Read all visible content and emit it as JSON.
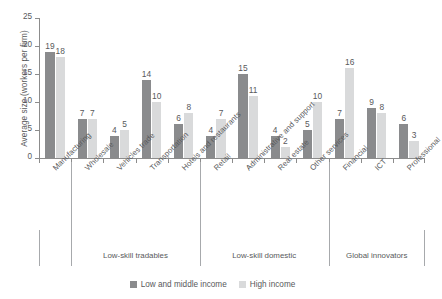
{
  "chart_data": {
    "type": "bar",
    "title": "",
    "xlabel": "",
    "ylabel": "Average size (workers per firm)",
    "ylim": [
      0,
      25
    ],
    "yticks": [
      0,
      5,
      10,
      15,
      20,
      25
    ],
    "grid": false,
    "legend_position": "bottom-center",
    "categories": [
      "Manufacturing",
      "Wholesale",
      "Vehicles trade",
      "Transportation",
      "Hotels and restaurants",
      "Retail",
      "Administrative and support",
      "Real estate",
      "Other services",
      "Financial",
      "ICT",
      "Professional"
    ],
    "series": [
      {
        "name": "Low and middle income",
        "color": "#8a8b8d",
        "values": [
          19,
          7,
          4,
          14,
          6,
          4,
          15,
          4,
          5,
          7,
          9,
          6
        ]
      },
      {
        "name": "High income",
        "color": "#d9dadb",
        "values": [
          18,
          7,
          5,
          10,
          8,
          7,
          11,
          2,
          10,
          16,
          8,
          3
        ]
      }
    ],
    "groups": [
      {
        "label": "",
        "categories": [
          "Manufacturing"
        ]
      },
      {
        "label": "Low-skill tradables",
        "categories": [
          "Wholesale",
          "Vehicles trade",
          "Transportation",
          "Hotels and restaurants"
        ]
      },
      {
        "label": "Low-skill domestic",
        "categories": [
          "Retail",
          "Administrative and support",
          "Real estate",
          "Other services"
        ]
      },
      {
        "label": "Global innovators",
        "categories": [
          "Financial",
          "ICT",
          "Professional"
        ]
      }
    ]
  },
  "axis": {
    "y_title": "Average size (workers per firm)",
    "y_tick_labels": [
      "0",
      "5",
      "10",
      "15",
      "20",
      "25"
    ]
  },
  "legend": {
    "items": [
      {
        "label": "Low and middle income",
        "swatch": "dark"
      },
      {
        "label": "High income",
        "swatch": "light"
      }
    ]
  },
  "groups": {
    "names": [
      "Low-skill tradables",
      "Low-skill domestic",
      "Global innovators"
    ]
  }
}
